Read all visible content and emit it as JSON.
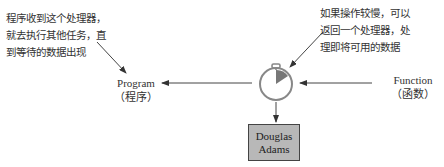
{
  "annotations": {
    "left_note": [
      "程序收到这个处理器，",
      "就去执行其他任务，直",
      "到等待的数据出现"
    ],
    "right_note": [
      "如果操作较慢，可以",
      "返回一个处理器，处",
      "理即将可用的数据"
    ]
  },
  "nodes": {
    "program": {
      "label": "Program",
      "sublabel": "（程序）"
    },
    "function": {
      "label": "Function",
      "sublabel": "（函数）"
    },
    "handle": {
      "icon": "stopwatch-icon"
    },
    "result": {
      "line1": "Douglas",
      "line2": "Adams"
    }
  },
  "colors": {
    "box_fill": "#b8b8b8",
    "stroke": "#555555",
    "icon_accent": "#777777"
  }
}
